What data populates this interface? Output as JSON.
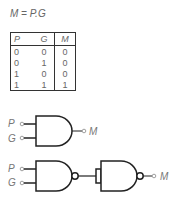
{
  "equation": "M = P.G",
  "truth_table": {
    "headers": [
      "P",
      "G",
      "M"
    ],
    "rows": [
      [
        "0",
        "0",
        "0"
      ],
      [
        "0",
        "1",
        "0"
      ],
      [
        "1",
        "0",
        "0"
      ],
      [
        "1",
        "1",
        "1"
      ]
    ]
  },
  "circuit_and": {
    "inputs": [
      "P",
      "G"
    ],
    "output": "M",
    "gate": "AND"
  },
  "circuit_nand": {
    "inputs": [
      "P",
      "G"
    ],
    "output": "M",
    "gates": [
      "NAND",
      "NAND (inverter)"
    ]
  }
}
